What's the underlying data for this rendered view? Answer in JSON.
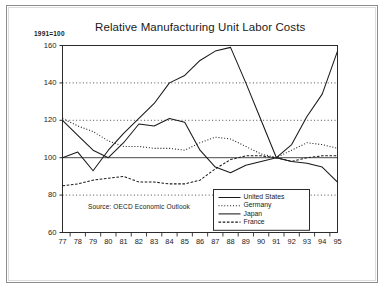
{
  "figure": {
    "title": "Relative Manufacturing Unit Labor Costs",
    "index_note": "1991=100",
    "source": "Source: OECD Economic Outlook"
  },
  "legend": {
    "position": "bottom-right",
    "entries": [
      {
        "label": "United States",
        "style": "solid"
      },
      {
        "label": "Germany",
        "style": "dotted"
      },
      {
        "label": "Japan",
        "style": "solid"
      },
      {
        "label": "France",
        "style": "dashed"
      }
    ]
  },
  "chart_data": {
    "type": "line",
    "title": "Relative Manufacturing Unit Labor Costs",
    "subtitle": "1991=100",
    "xlabel": "",
    "ylabel": "1991=100",
    "annotation": "Source: OECD Economic Outlook",
    "grid": true,
    "gridlines_y": [
      80,
      100,
      120,
      140
    ],
    "xlim": [
      1977,
      1995
    ],
    "ylim": [
      60,
      160
    ],
    "yticks": [
      60,
      80,
      100,
      120,
      140,
      160
    ],
    "xticks": [
      1977,
      1978,
      1979,
      1980,
      1981,
      1982,
      1983,
      1984,
      1985,
      1986,
      1987,
      1988,
      1989,
      1990,
      1991,
      1992,
      1993,
      1994,
      1995
    ],
    "xtick_labels": [
      "77",
      "78",
      "79",
      "80",
      "81",
      "82",
      "83",
      "84",
      "85",
      "86",
      "87",
      "88",
      "89",
      "90",
      "91",
      "92",
      "93",
      "94",
      "95"
    ],
    "categories": [
      "77",
      "78",
      "79",
      "80",
      "81",
      "82",
      "83",
      "84",
      "85",
      "86",
      "87",
      "88",
      "89",
      "90",
      "91",
      "92",
      "93",
      "94",
      "95"
    ],
    "series": [
      {
        "name": "United States",
        "style": "solid",
        "values": [
          120,
          112,
          104,
          100,
          108,
          118,
          117,
          121,
          119,
          104,
          95,
          92,
          96,
          98,
          100,
          98,
          97,
          95,
          87
        ]
      },
      {
        "name": "Germany",
        "style": "dotted",
        "values": [
          121,
          117,
          114,
          109,
          106,
          106,
          105,
          105,
          104,
          108,
          111,
          110,
          106,
          102,
          100,
          104,
          108,
          107,
          105
        ]
      },
      {
        "name": "Japan",
        "style": "solid",
        "values": [
          100,
          103,
          93,
          104,
          113,
          121,
          129,
          140,
          144,
          152,
          157,
          159,
          140,
          120,
          100,
          107,
          122,
          134,
          157
        ]
      },
      {
        "name": "France",
        "style": "dashed",
        "values": [
          85,
          86,
          88,
          89,
          90,
          87,
          87,
          86,
          86,
          88,
          94,
          99,
          101,
          101,
          100,
          98,
          100,
          101,
          101
        ]
      }
    ]
  }
}
